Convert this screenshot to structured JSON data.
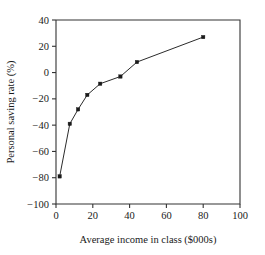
{
  "chart_data": {
    "type": "line",
    "title": "",
    "xlabel": "Average income in class ($000s)",
    "ylabel": "Personal saving rate (%)",
    "xlim": [
      0,
      100
    ],
    "ylim": [
      -100,
      40
    ],
    "xticks": [
      0,
      20,
      40,
      60,
      80,
      100
    ],
    "yticks": [
      40,
      20,
      0,
      -20,
      -40,
      -60,
      -80,
      -100
    ],
    "xtick_labels": [
      "0",
      "20",
      "40",
      "60",
      "80",
      "100"
    ],
    "ytick_labels": [
      "40",
      "20",
      "0",
      "−20",
      "−40",
      "−60",
      "−80",
      "−100"
    ],
    "grid": false,
    "legend": false,
    "legend_position": "none",
    "marker": "filled-square",
    "line_color": "#2b2b2b",
    "marker_color": "#1a1a1a",
    "frame_color": "#333333",
    "background_color": "#ffffff",
    "series": [
      {
        "name": "Personal saving rate",
        "x": [
          2,
          7.5,
          12,
          17,
          24,
          35,
          44,
          80
        ],
        "y": [
          -79,
          -39,
          -28,
          -17,
          -8.5,
          -3,
          8,
          27
        ]
      }
    ]
  },
  "axes": {
    "x_title": "Average income in class ($000s)",
    "y_title": "Personal saving rate (%)"
  }
}
